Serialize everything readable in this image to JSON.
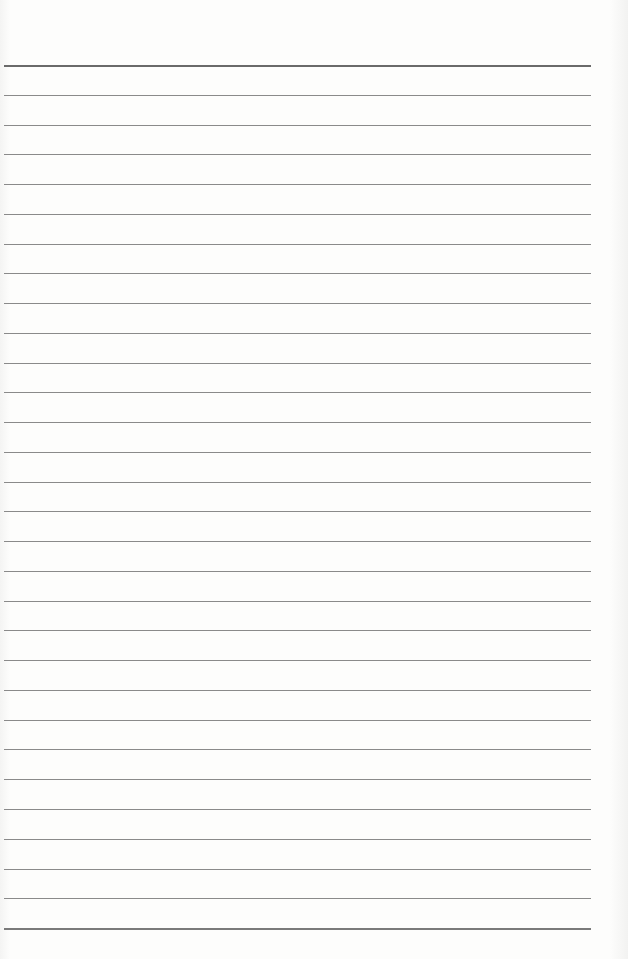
{
  "page": {
    "type": "blank-ruled-sheet",
    "line_count": 30,
    "first_line_y": 65,
    "line_spacing": 29.76,
    "line_left": 4,
    "line_width": 587,
    "line_color": "#8a8a8a",
    "paper_color": "#fbfbfa"
  }
}
